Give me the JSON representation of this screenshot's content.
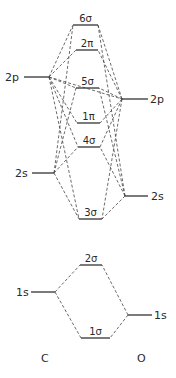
{
  "atoms": {
    "left": {
      "label": "C",
      "x": 41,
      "y": 362
    },
    "right": {
      "label": "O",
      "x": 137,
      "y": 362
    }
  },
  "atomic_orbitals": [
    {
      "id": "C2p",
      "label": "2p",
      "atom": "C",
      "x1": 24,
      "x2": 49,
      "y": 77,
      "label_x": 5,
      "label_y": 81,
      "anchor": "start"
    },
    {
      "id": "C2s",
      "label": "2s",
      "atom": "C",
      "x1": 32,
      "x2": 54,
      "y": 173,
      "label_x": 15,
      "label_y": 177,
      "anchor": "start"
    },
    {
      "id": "C1s",
      "label": "1s",
      "atom": "C",
      "x1": 31,
      "x2": 55,
      "y": 292,
      "label_x": 16,
      "label_y": 296,
      "anchor": "start"
    },
    {
      "id": "O2p",
      "label": "2p",
      "atom": "O",
      "x1": 122,
      "x2": 148,
      "y": 99,
      "label_x": 150,
      "label_y": 103,
      "anchor": "start"
    },
    {
      "id": "O2s",
      "label": "2s",
      "atom": "O",
      "x1": 125,
      "x2": 148,
      "y": 196,
      "label_x": 151,
      "label_y": 200,
      "anchor": "start"
    },
    {
      "id": "O1s",
      "label": "1s",
      "atom": "O",
      "x1": 128,
      "x2": 152,
      "y": 315,
      "label_x": 154,
      "label_y": 319,
      "anchor": "start"
    }
  ],
  "molecular_orbitals": [
    {
      "id": "6s",
      "label": "6σ",
      "x1": 73,
      "x2": 98,
      "y": 25
    },
    {
      "id": "2pi",
      "label": "2π",
      "x1": 76,
      "x2": 98,
      "y": 50
    },
    {
      "id": "5s",
      "label": "5σ",
      "x1": 76,
      "x2": 99,
      "y": 88
    },
    {
      "id": "1pi",
      "label": "1π",
      "x1": 77,
      "x2": 100,
      "y": 123
    },
    {
      "id": "4s",
      "label": "4σ",
      "x1": 78,
      "x2": 100,
      "y": 147
    },
    {
      "id": "3s",
      "label": "3σ",
      "x1": 79,
      "x2": 102,
      "y": 219
    },
    {
      "id": "2s",
      "label": "2σ",
      "x1": 80,
      "x2": 102,
      "y": 265
    },
    {
      "id": "1s",
      "label": "1σ",
      "x1": 81,
      "x2": 110,
      "y": 338
    }
  ],
  "connections": [
    [
      "C2p",
      "6s"
    ],
    [
      "C2p",
      "2pi"
    ],
    [
      "C2p",
      "5s"
    ],
    [
      "C2p",
      "1pi"
    ],
    [
      "C2p",
      "4s"
    ],
    [
      "C2p",
      "3s"
    ],
    [
      "C2p",
      "O2p"
    ],
    [
      "C2s",
      "6s"
    ],
    [
      "C2s",
      "5s"
    ],
    [
      "C2s",
      "4s"
    ],
    [
      "C2s",
      "3s"
    ],
    [
      "O2p",
      "6s"
    ],
    [
      "O2p",
      "2pi"
    ],
    [
      "O2p",
      "5s"
    ],
    [
      "O2p",
      "1pi"
    ],
    [
      "O2p",
      "4s"
    ],
    [
      "O2p",
      "3s"
    ],
    [
      "O2s",
      "6s"
    ],
    [
      "O2s",
      "5s"
    ],
    [
      "O2s",
      "4s"
    ],
    [
      "O2s",
      "3s"
    ],
    [
      "C1s",
      "2s"
    ],
    [
      "C1s",
      "1s"
    ],
    [
      "O1s",
      "2s"
    ],
    [
      "O1s",
      "1s"
    ]
  ]
}
